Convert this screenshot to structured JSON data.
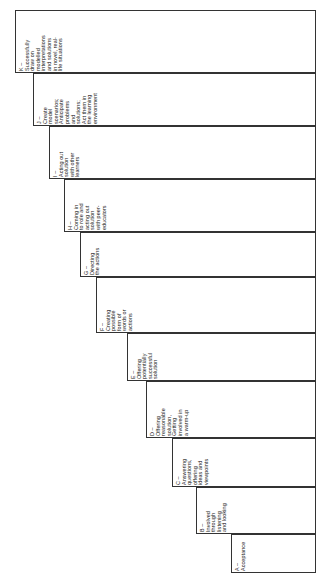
{
  "diagram": {
    "type": "staircase-cascade",
    "orientation": "rotated-90-counterclockwise",
    "title": "",
    "box_border_color": "#333333",
    "box_fill_color": "#ffffff",
    "text_color": "#1a1a1a",
    "steps": [
      {
        "id": "K",
        "code": "K –",
        "lines": [
          "Successfully",
          "draw on",
          "modelled",
          "interpretations",
          "and solutions",
          "in novel, real-",
          "life situations"
        ]
      },
      {
        "id": "J",
        "code": "J –",
        "lines": [
          "Create",
          "model",
          "scenarios;",
          "Anticipate",
          "problems",
          "and",
          "solutions;",
          "Act them in",
          "the learning",
          "environment"
        ]
      },
      {
        "id": "I",
        "code": "I –",
        "lines": [
          "Acting out",
          "solution",
          "with other",
          "learners"
        ]
      },
      {
        "id": "H",
        "code": "H –",
        "lines": [
          "Coming in",
          "to role and",
          "acting out",
          "solution",
          "with peer-",
          "educators"
        ]
      },
      {
        "id": "G",
        "code": "G –",
        "lines": [
          "Directing",
          "the actions"
        ]
      },
      {
        "id": "F",
        "code": "F –",
        "lines": [
          "Creating",
          "possible",
          "form of",
          "words or",
          "actions"
        ]
      },
      {
        "id": "E",
        "code": "E –",
        "lines": [
          "Offering",
          "potentially",
          "successful",
          "solution"
        ]
      },
      {
        "id": "D",
        "code": "D –",
        "lines": [
          "Offering",
          "reasonable",
          "solution,",
          "Getting",
          "involved in",
          "a warm-up"
        ]
      },
      {
        "id": "C",
        "code": "C –",
        "lines": [
          "Answering",
          "questions,",
          "offering",
          "ideas and",
          "viewpoints"
        ]
      },
      {
        "id": "B",
        "code": "B –",
        "lines": [
          "Involved",
          "through",
          "listening",
          "and looking"
        ]
      },
      {
        "id": "A",
        "code": "A –",
        "lines": [
          "Acceptance"
        ]
      }
    ]
  }
}
